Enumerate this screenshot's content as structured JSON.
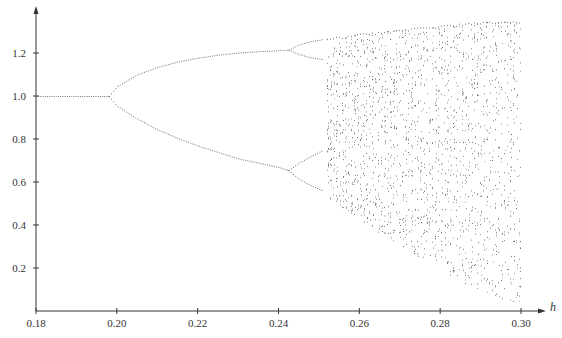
{
  "chart_data": {
    "type": "scatter",
    "title": "",
    "subtitle": "",
    "xlabel": "h",
    "ylabel": "",
    "xlim": [
      0.18,
      0.3
    ],
    "ylim": [
      0.0,
      1.35
    ],
    "grid": false,
    "legend": null,
    "x_ticks": [
      "0.18",
      "0.20",
      "0.22",
      "0.24",
      "0.26",
      "0.28",
      "0.30"
    ],
    "y_ticks": [
      "0.2",
      "0.4",
      "0.6",
      "0.8",
      "1.0",
      "1.2"
    ],
    "bifurcation_points": [
      {
        "h": 0.198,
        "type": "period-1 to period-2",
        "x": 1.0
      },
      {
        "h": 0.2425,
        "type": "period-2 to period-4 (upper)",
        "x": 1.215
      },
      {
        "h": 0.2425,
        "type": "period-2 to period-4 (lower)",
        "x": 0.655
      },
      {
        "h": 0.252,
        "type": "onset of chaos",
        "x": null
      }
    ],
    "series": [
      {
        "name": "fixed-point",
        "h": [
          0.18,
          0.185,
          0.19,
          0.195,
          0.198
        ],
        "x": [
          1.0,
          1.0,
          1.0,
          1.0,
          1.0
        ]
      },
      {
        "name": "period-2-upper",
        "h": [
          0.198,
          0.2,
          0.205,
          0.21,
          0.215,
          0.22,
          0.225,
          0.23,
          0.235,
          0.24,
          0.2425
        ],
        "x": [
          1.0,
          1.045,
          1.1,
          1.135,
          1.16,
          1.178,
          1.192,
          1.202,
          1.208,
          1.213,
          1.215
        ]
      },
      {
        "name": "period-2-lower",
        "h": [
          0.198,
          0.2,
          0.205,
          0.21,
          0.215,
          0.22,
          0.225,
          0.23,
          0.235,
          0.24,
          0.2425
        ],
        "x": [
          1.0,
          0.955,
          0.895,
          0.845,
          0.805,
          0.77,
          0.74,
          0.71,
          0.69,
          0.67,
          0.655
        ]
      },
      {
        "name": "period-4-upper-a",
        "h": [
          0.2425,
          0.245,
          0.248,
          0.251
        ],
        "x": [
          1.215,
          1.24,
          1.255,
          1.265
        ]
      },
      {
        "name": "period-4-upper-b",
        "h": [
          0.2425,
          0.245,
          0.248,
          0.251
        ],
        "x": [
          1.215,
          1.195,
          1.18,
          1.17
        ]
      },
      {
        "name": "period-4-lower-a",
        "h": [
          0.2425,
          0.245,
          0.248,
          0.251
        ],
        "x": [
          0.655,
          0.69,
          0.72,
          0.75
        ]
      },
      {
        "name": "period-4-lower-b",
        "h": [
          0.2425,
          0.245,
          0.248,
          0.251
        ],
        "x": [
          0.655,
          0.615,
          0.585,
          0.56
        ]
      }
    ],
    "chaotic_envelope": {
      "h": [
        0.252,
        0.26,
        0.27,
        0.28,
        0.29,
        0.3
      ],
      "upper": [
        1.27,
        1.29,
        1.31,
        1.33,
        1.345,
        1.35
      ],
      "lower": [
        0.53,
        0.42,
        0.3,
        0.19,
        0.09,
        0.03
      ]
    }
  }
}
